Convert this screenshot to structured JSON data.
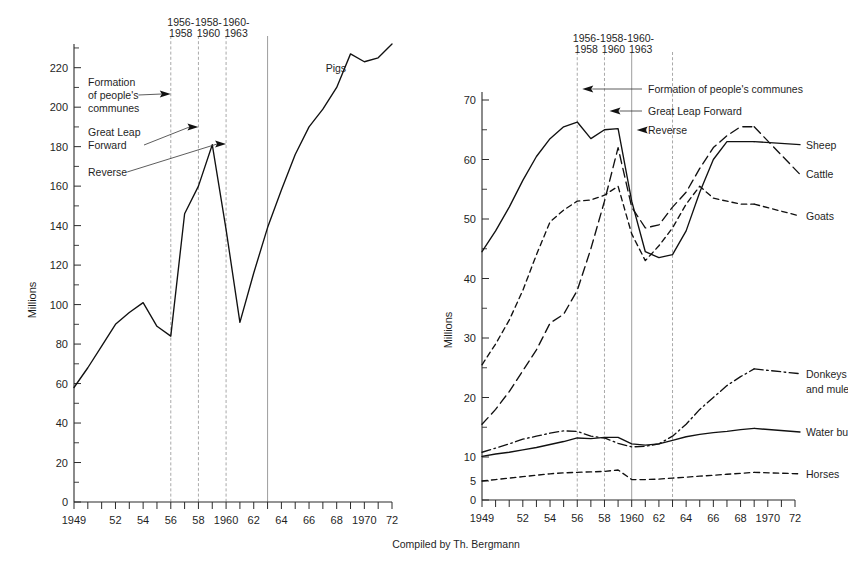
{
  "figure": {
    "credit": "Compiled by Th. Bergmann"
  },
  "chart_data": [
    {
      "id": "pigs",
      "type": "line",
      "title": "",
      "xlabel": "",
      "ylabel": "Millions",
      "xlim": [
        1949,
        1972
      ],
      "ylim": [
        0,
        232
      ],
      "grid": false,
      "legend_position": "inline-right",
      "y_major_ticks": [
        0,
        20,
        40,
        60,
        80,
        100,
        120,
        140,
        160,
        180,
        200,
        220
      ],
      "y_major_tick_labels": [
        "0",
        "20",
        "40",
        "60",
        "80",
        "100",
        "120",
        "140",
        "160",
        "180",
        "200",
        "220"
      ],
      "y_minor_ticks": [
        10,
        30,
        50,
        70,
        90,
        110,
        130,
        150,
        170,
        190,
        210,
        230
      ],
      "x_ticks": [
        1949,
        1950,
        1951,
        1952,
        1953,
        1954,
        1955,
        1956,
        1957,
        1958,
        1959,
        1960,
        1961,
        1962,
        1963,
        1964,
        1965,
        1966,
        1967,
        1968,
        1969,
        1970,
        1971,
        1972
      ],
      "x_tick_labels": [
        "1949",
        "",
        "",
        "52",
        "",
        "54",
        "",
        "56",
        "",
        "58",
        "",
        "1960",
        "62",
        "",
        "64",
        "",
        "66",
        "",
        "68",
        "",
        "1970",
        "",
        "72"
      ],
      "x_labeled": [
        {
          "x": 1949,
          "label": "1949"
        },
        {
          "x": 1952,
          "label": "52"
        },
        {
          "x": 1954,
          "label": "54"
        },
        {
          "x": 1956,
          "label": "56"
        },
        {
          "x": 1958,
          "label": "58"
        },
        {
          "x": 1960,
          "label": "1960"
        },
        {
          "x": 1962,
          "label": "62"
        },
        {
          "x": 1964,
          "label": "64"
        },
        {
          "x": 1966,
          "label": "66"
        },
        {
          "x": 1968,
          "label": "68"
        },
        {
          "x": 1970,
          "label": "1970"
        },
        {
          "x": 1972,
          "label": "72"
        }
      ],
      "series": [
        {
          "name": "Pigs",
          "style": "solid",
          "label_x": 1967.2,
          "label_y": 218,
          "x": [
            1949,
            1950,
            1951,
            1952,
            1953,
            1954,
            1955,
            1956,
            1957,
            1958,
            1959,
            1960,
            1961,
            1962,
            1963,
            1964,
            1965,
            1966,
            1967,
            1968,
            1969,
            1970,
            1971,
            1972
          ],
          "values": [
            58,
            68,
            79,
            90,
            96,
            101,
            89,
            84,
            146,
            160,
            181,
            138,
            91,
            116,
            139,
            158,
            176,
            190,
            199,
            210,
            227,
            223,
            225,
            232
          ]
        }
      ],
      "event_markers": [
        {
          "x": 1956,
          "label_line1": "1956-",
          "label_line2": "1958"
        },
        {
          "x": 1958,
          "label_line1": "1958-",
          "label_line2": "1960"
        },
        {
          "x": 1960,
          "label_line1": "1960-",
          "label_line2": "1963"
        },
        {
          "x": 1963,
          "label_line1": "",
          "label_line2": ""
        }
      ],
      "annotations": [
        {
          "id": "formation",
          "lines": [
            "Formation",
            "of people's",
            "communes"
          ]
        },
        {
          "id": "glf",
          "lines": [
            "Great Leap",
            "Forward"
          ]
        },
        {
          "id": "reverse",
          "lines": [
            "Reverse"
          ]
        }
      ]
    },
    {
      "id": "livestock",
      "type": "line",
      "title": "",
      "xlabel": "",
      "ylabel": "Millions",
      "xlim": [
        1949,
        1972
      ],
      "ylim": [
        0,
        73
      ],
      "grid": false,
      "legend_position": "inline-right",
      "y_major_ticks": [
        0,
        5,
        10,
        20,
        30,
        40,
        50,
        60,
        70
      ],
      "y_major_tick_labels": [
        "0",
        "5",
        "10",
        "20",
        "30",
        "40",
        "50",
        "60",
        "70"
      ],
      "y_minor_ticks": [
        15,
        25,
        35,
        45,
        55,
        65
      ],
      "x_labeled": [
        {
          "x": 1949,
          "label": "1949"
        },
        {
          "x": 1952,
          "label": "52"
        },
        {
          "x": 1954,
          "label": "54"
        },
        {
          "x": 1956,
          "label": "56"
        },
        {
          "x": 1958,
          "label": "58"
        },
        {
          "x": 1960,
          "label": "1960"
        },
        {
          "x": 1962,
          "label": "62"
        },
        {
          "x": 1964,
          "label": "64"
        },
        {
          "x": 1966,
          "label": "66"
        },
        {
          "x": 1968,
          "label": "68"
        },
        {
          "x": 1970,
          "label": "1970"
        },
        {
          "x": 1972,
          "label": "72"
        }
      ],
      "series": [
        {
          "name": "Sheep",
          "style": "solid",
          "x": [
            1949,
            1950,
            1951,
            1952,
            1953,
            1954,
            1955,
            1956,
            1957,
            1958,
            1959,
            1960,
            1961,
            1962,
            1963,
            1964,
            1965,
            1966,
            1967,
            1968,
            1969
          ],
          "values": [
            44.5,
            48,
            52,
            56.5,
            60.5,
            63.5,
            65.5,
            66.3,
            63.5,
            65,
            65.2,
            53,
            44.5,
            43.5,
            44,
            48,
            54.5,
            60,
            63,
            63,
            63
          ]
        },
        {
          "name": "Cattle",
          "style": "dash-long",
          "x": [
            1949,
            1950,
            1951,
            1952,
            1953,
            1954,
            1955,
            1956,
            1957,
            1958,
            1959,
            1960,
            1961,
            1962,
            1963,
            1964,
            1965,
            1966,
            1967,
            1968,
            1969
          ],
          "values": [
            15.5,
            18,
            21,
            24.5,
            28,
            32.5,
            34,
            38,
            45,
            53,
            62,
            52,
            48.5,
            49,
            52,
            54.5,
            58.5,
            62,
            64,
            65.5,
            65.5
          ]
        },
        {
          "name": "Goats",
          "style": "dash-short",
          "x": [
            1949,
            1950,
            1951,
            1952,
            1953,
            1954,
            1955,
            1956,
            1957,
            1958,
            1959,
            1960,
            1961,
            1962,
            1963,
            1964,
            1965,
            1966,
            1967,
            1968,
            1969
          ],
          "values": [
            25.5,
            29,
            33,
            38,
            44,
            49.5,
            51.5,
            53,
            53.2,
            54,
            55.5,
            47.5,
            43,
            45.5,
            48.5,
            52.5,
            55.5,
            53.5,
            53,
            52.5,
            52.5
          ]
        },
        {
          "name": "Donkeys and mules",
          "style": "dashdot",
          "x": [
            1949,
            1950,
            1951,
            1952,
            1953,
            1954,
            1955,
            1956,
            1957,
            1958,
            1959,
            1960,
            1961,
            1962,
            1963,
            1964,
            1965,
            1966,
            1967,
            1968,
            1969
          ],
          "values": [
            10.8,
            11.5,
            12.2,
            13,
            13.5,
            14,
            14.4,
            14.3,
            13.5,
            13.2,
            12.3,
            11.7,
            11.8,
            12.2,
            13.5,
            15.5,
            18,
            20,
            22,
            23.5,
            24.8
          ]
        },
        {
          "name": "Water buffalo",
          "style": "solid",
          "x": [
            1949,
            1950,
            1951,
            1952,
            1953,
            1954,
            1955,
            1956,
            1957,
            1958,
            1959,
            1960,
            1961,
            1962,
            1963,
            1964,
            1965,
            1966,
            1967,
            1968,
            1969
          ],
          "values": [
            10.1,
            10.5,
            10.8,
            11.2,
            11.6,
            12.1,
            12.6,
            13.2,
            13.1,
            13.3,
            13.3,
            12.2,
            12,
            12.2,
            12.8,
            13.4,
            13.8,
            14.1,
            14.3,
            14.6,
            14.8
          ]
        },
        {
          "name": "Horses",
          "style": "dash-short",
          "x": [
            1949,
            1950,
            1951,
            1952,
            1953,
            1954,
            1955,
            1956,
            1957,
            1958,
            1959,
            1960,
            1961,
            1962,
            1963,
            1964,
            1965,
            1966,
            1967,
            1968,
            1969
          ],
          "values": [
            5.0,
            5.3,
            5.6,
            5.9,
            6.2,
            6.5,
            6.7,
            6.8,
            6.9,
            7.0,
            7.3,
            5.3,
            5.3,
            5.4,
            5.6,
            5.8,
            6.0,
            6.2,
            6.4,
            6.6,
            6.8
          ]
        }
      ],
      "series_labels": [
        {
          "name": "Sheep",
          "y": 62.5
        },
        {
          "name": "Cattle",
          "y": 57.5
        },
        {
          "name": "Goats",
          "y": 50.5
        },
        {
          "name": "Donkeys",
          "y": 24.0
        },
        {
          "name": "and mules",
          "y": 21.5
        },
        {
          "name": "Water buffalo",
          "y": 14.2
        },
        {
          "name": "Horses",
          "y": 6.5
        }
      ],
      "event_markers": [
        {
          "x": 1956,
          "label_line1": "1956-",
          "label_line2": "1958"
        },
        {
          "x": 1958,
          "label_line1": "1958-",
          "label_line2": "1960"
        },
        {
          "x": 1960,
          "label_line1": "1960-",
          "label_line2": "1963"
        },
        {
          "x": 1963,
          "label_line1": "",
          "label_line2": ""
        }
      ],
      "annotations": [
        {
          "id": "formation",
          "text": "Formation of people's communes"
        },
        {
          "id": "glf",
          "text": "Great Leap Forward"
        },
        {
          "id": "reverse",
          "text": "Reverse"
        }
      ]
    }
  ]
}
